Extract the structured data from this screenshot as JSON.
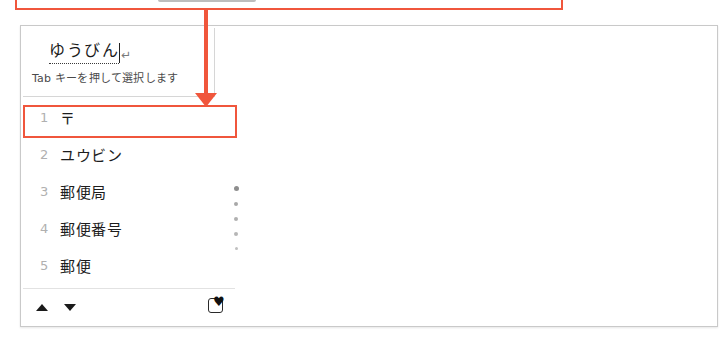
{
  "window": {
    "title_visible": false,
    "accent_color": "#f0563c",
    "border_color": "#c9c9c9"
  },
  "composition": {
    "text": "ゆうびん",
    "return_mark": "↵",
    "hint": "Tab キーを押して選択します"
  },
  "candidates": {
    "items": [
      {
        "index": "1",
        "text": "〒",
        "selected": true
      },
      {
        "index": "2",
        "text": "ユウビン",
        "selected": false
      },
      {
        "index": "3",
        "text": "郵便局",
        "selected": false
      },
      {
        "index": "4",
        "text": "郵便番号",
        "selected": false
      },
      {
        "index": "5",
        "text": "郵便",
        "selected": false
      }
    ]
  },
  "scroll_indicator": {
    "dot_count": 5,
    "active_dot": 1
  },
  "toolbar": {
    "prev_page_icon": "triangle-up-icon",
    "next_page_icon": "triangle-down-icon",
    "ime_pad_icon": "ime-pad-icon",
    "ime_pad_glyph": "♥"
  },
  "annotations": {
    "color": "#f0563c",
    "top_box_label": "",
    "highlight_row_index": "1",
    "arrow_direction": "down"
  }
}
